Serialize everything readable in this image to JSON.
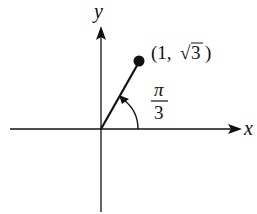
{
  "diagram": {
    "type": "polar-coordinate-illustration",
    "axes": {
      "x_label": "x",
      "y_label": "y"
    },
    "point": {
      "label_open": "(1,",
      "label_radicand": "3",
      "label_close": ")",
      "x": 1,
      "y_sqrt": 3
    },
    "angle": {
      "numerator": "π",
      "denominator": "3"
    },
    "colors": {
      "ink": "#111111",
      "background": "#ffffff"
    }
  }
}
